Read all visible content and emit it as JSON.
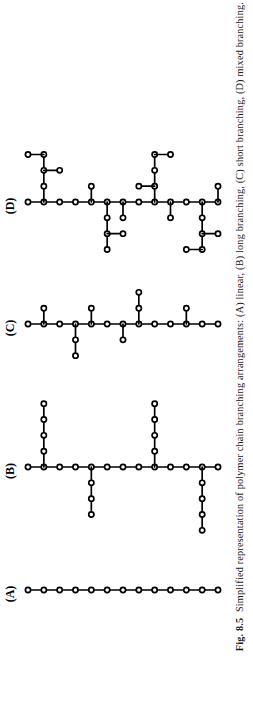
{
  "figure": {
    "number_label": "Fig. 8.5",
    "caption_text": "Simplified representation of polymer chain branching arrangements: (A) linear, (B) long branching, (C) short branching, (D) mixed branching.",
    "orientation": "rotated-90-ccw",
    "node_style": {
      "fill": "#ffffff",
      "stroke": "#000000",
      "radius_px": 2.6,
      "stroke_width_px": 1.7
    },
    "bond_style": {
      "stroke": "#000000",
      "stroke_width_px": 1.7
    },
    "background_color": "#ffffff"
  },
  "panels": [
    {
      "id": "D",
      "label": "(D)",
      "name": "mixed branching",
      "label_xy": [
        11,
        206
      ],
      "backbone": {
        "y": 202,
        "x_start": 28,
        "x_end": 218,
        "count": 13,
        "spacing": 15.833
      },
      "branches": [
        {
          "at_index": 1,
          "direction": "up",
          "length": 3,
          "stubs": [
            {
              "level": 3,
              "side": "left",
              "length": 1
            },
            {
              "level": 2,
              "side": "right",
              "length": 1
            }
          ]
        },
        {
          "at_index": 4,
          "direction": "up",
          "length": 1,
          "stubs": []
        },
        {
          "at_index": 5,
          "direction": "down",
          "length": 3,
          "stubs": [
            {
              "level": 2,
              "side": "right",
              "length": 1
            }
          ]
        },
        {
          "at_index": 6,
          "direction": "down",
          "length": 1,
          "stubs": []
        },
        {
          "at_index": 8,
          "direction": "up",
          "length": 3,
          "stubs": [
            {
              "level": 3,
              "side": "right",
              "length": 1
            },
            {
              "level": 1,
              "side": "left",
              "length": 1
            }
          ]
        },
        {
          "at_index": 9,
          "direction": "down",
          "length": 1,
          "stubs": []
        },
        {
          "at_index": 11,
          "direction": "down",
          "length": 3,
          "stubs": [
            {
              "level": 2,
              "side": "right",
              "length": 1
            },
            {
              "level": 3,
              "side": "left",
              "length": 1
            }
          ]
        },
        {
          "at_index": 12,
          "direction": "up",
          "length": 1,
          "stubs": []
        }
      ]
    },
    {
      "id": "C",
      "label": "(C)",
      "name": "short branching",
      "label_xy": [
        11,
        328
      ],
      "backbone": {
        "y": 324,
        "x_start": 28,
        "x_end": 218,
        "count": 13,
        "spacing": 15.833
      },
      "branches": [
        {
          "at_index": 1,
          "direction": "up",
          "length": 1,
          "stubs": []
        },
        {
          "at_index": 3,
          "direction": "down",
          "length": 2,
          "stubs": []
        },
        {
          "at_index": 4,
          "direction": "up",
          "length": 1,
          "stubs": []
        },
        {
          "at_index": 6,
          "direction": "down",
          "length": 1,
          "stubs": []
        },
        {
          "at_index": 7,
          "direction": "up",
          "length": 2,
          "stubs": []
        },
        {
          "at_index": 10,
          "direction": "up",
          "length": 1,
          "stubs": []
        }
      ]
    },
    {
      "id": "B",
      "label": "(B)",
      "name": "long branching",
      "label_xy": [
        11,
        471
      ],
      "backbone": {
        "y": 467,
        "x_start": 28,
        "x_end": 218,
        "count": 13,
        "spacing": 15.833
      },
      "branches": [
        {
          "at_index": 1,
          "direction": "up",
          "length": 4,
          "stubs": []
        },
        {
          "at_index": 4,
          "direction": "down",
          "length": 3,
          "stubs": []
        },
        {
          "at_index": 8,
          "direction": "up",
          "length": 4,
          "stubs": []
        },
        {
          "at_index": 11,
          "direction": "down",
          "length": 4,
          "stubs": []
        }
      ]
    },
    {
      "id": "A",
      "label": "(A)",
      "name": "linear",
      "label_xy": [
        11,
        594
      ],
      "backbone": {
        "y": 590,
        "x_start": 28,
        "x_end": 218,
        "count": 13,
        "spacing": 15.833
      },
      "branches": []
    }
  ]
}
